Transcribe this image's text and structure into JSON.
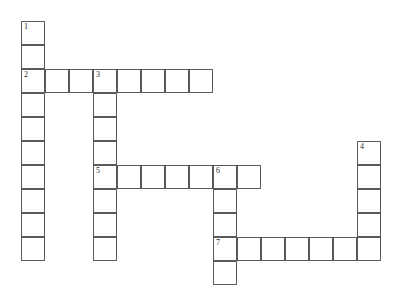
{
  "puzzle": {
    "title": "Crossword Grid",
    "cell_size": 24,
    "origin_x": 21,
    "origin_y": 21,
    "grid_cols": 16,
    "grid_rows": 11,
    "border_color": "#555b5e",
    "cell_fill": "#ffffff",
    "number_color": "#2a2e30",
    "background": "#ffffff",
    "entries": [
      {
        "number": "1",
        "direction": "down",
        "row": 0,
        "col": 0,
        "length": 10
      },
      {
        "number": "2",
        "direction": "across",
        "row": 2,
        "col": 0,
        "length": 8
      },
      {
        "number": "3",
        "direction": "down",
        "row": 2,
        "col": 3,
        "length": 8
      },
      {
        "number": "4",
        "direction": "down",
        "row": 5,
        "col": 14,
        "length": 5
      },
      {
        "number": "5",
        "direction": "across",
        "row": 6,
        "col": 3,
        "length": 7
      },
      {
        "number": "6",
        "direction": "down",
        "row": 6,
        "col": 8,
        "length": 5
      },
      {
        "number": "7",
        "direction": "across",
        "row": 9,
        "col": 8,
        "length": 7
      }
    ],
    "cells": [
      {
        "row": 0,
        "col": 0,
        "number": "1"
      },
      {
        "row": 1,
        "col": 0,
        "number": ""
      },
      {
        "row": 2,
        "col": 0,
        "number": "2"
      },
      {
        "row": 2,
        "col": 1,
        "number": ""
      },
      {
        "row": 2,
        "col": 2,
        "number": ""
      },
      {
        "row": 2,
        "col": 3,
        "number": "3"
      },
      {
        "row": 2,
        "col": 4,
        "number": ""
      },
      {
        "row": 2,
        "col": 5,
        "number": ""
      },
      {
        "row": 2,
        "col": 6,
        "number": ""
      },
      {
        "row": 2,
        "col": 7,
        "number": ""
      },
      {
        "row": 3,
        "col": 0,
        "number": ""
      },
      {
        "row": 3,
        "col": 3,
        "number": ""
      },
      {
        "row": 4,
        "col": 0,
        "number": ""
      },
      {
        "row": 4,
        "col": 3,
        "number": ""
      },
      {
        "row": 5,
        "col": 0,
        "number": ""
      },
      {
        "row": 5,
        "col": 3,
        "number": ""
      },
      {
        "row": 5,
        "col": 14,
        "number": "4"
      },
      {
        "row": 6,
        "col": 0,
        "number": ""
      },
      {
        "row": 6,
        "col": 3,
        "number": "5"
      },
      {
        "row": 6,
        "col": 4,
        "number": ""
      },
      {
        "row": 6,
        "col": 5,
        "number": ""
      },
      {
        "row": 6,
        "col": 6,
        "number": ""
      },
      {
        "row": 6,
        "col": 7,
        "number": ""
      },
      {
        "row": 6,
        "col": 8,
        "number": "6"
      },
      {
        "row": 6,
        "col": 9,
        "number": ""
      },
      {
        "row": 6,
        "col": 14,
        "number": ""
      },
      {
        "row": 7,
        "col": 0,
        "number": ""
      },
      {
        "row": 7,
        "col": 3,
        "number": ""
      },
      {
        "row": 7,
        "col": 8,
        "number": ""
      },
      {
        "row": 7,
        "col": 14,
        "number": ""
      },
      {
        "row": 8,
        "col": 0,
        "number": ""
      },
      {
        "row": 8,
        "col": 3,
        "number": ""
      },
      {
        "row": 8,
        "col": 8,
        "number": ""
      },
      {
        "row": 8,
        "col": 14,
        "number": ""
      },
      {
        "row": 9,
        "col": 0,
        "number": ""
      },
      {
        "row": 9,
        "col": 3,
        "number": ""
      },
      {
        "row": 9,
        "col": 8,
        "number": "7"
      },
      {
        "row": 9,
        "col": 9,
        "number": ""
      },
      {
        "row": 9,
        "col": 10,
        "number": ""
      },
      {
        "row": 9,
        "col": 11,
        "number": ""
      },
      {
        "row": 9,
        "col": 12,
        "number": ""
      },
      {
        "row": 9,
        "col": 13,
        "number": ""
      },
      {
        "row": 9,
        "col": 14,
        "number": ""
      },
      {
        "row": 10,
        "col": 8,
        "number": ""
      }
    ]
  }
}
